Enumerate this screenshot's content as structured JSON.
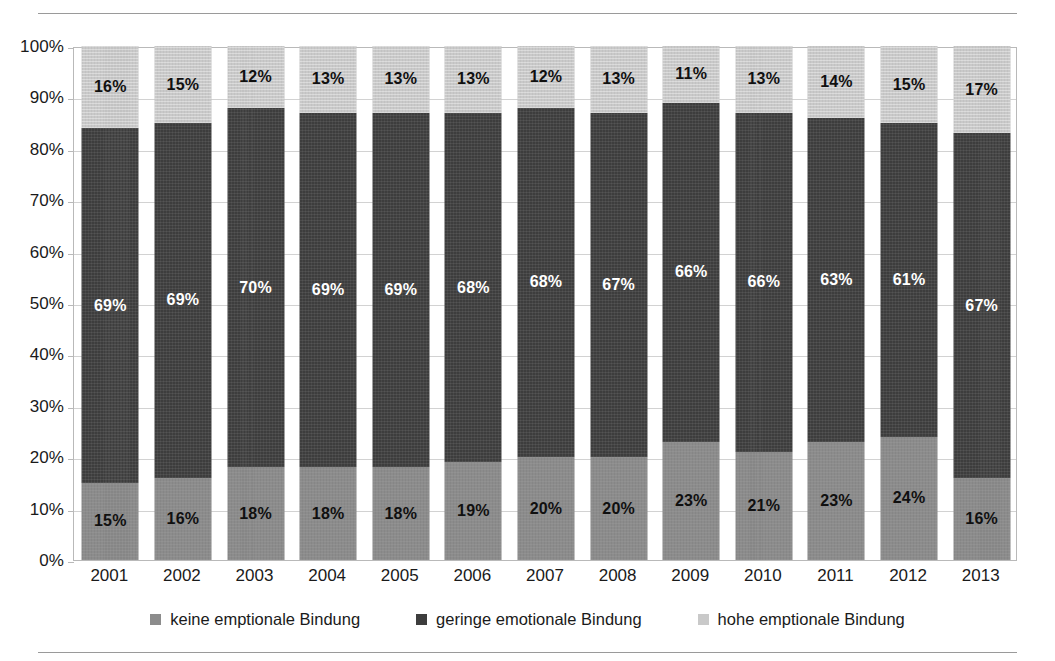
{
  "chart_data": {
    "type": "bar",
    "subtype": "stacked-bar-100",
    "title": "",
    "subtitle": "",
    "xlabel": "",
    "ylabel": "",
    "ylim": [
      0,
      100
    ],
    "ytick_labels": [
      "0%",
      "10%",
      "20%",
      "30%",
      "40%",
      "50%",
      "60%",
      "70%",
      "80%",
      "90%",
      "100%"
    ],
    "ytick_values": [
      0,
      10,
      20,
      30,
      40,
      50,
      60,
      70,
      80,
      90,
      100
    ],
    "grid": true,
    "legend_position": "bottom",
    "value_suffix": "%",
    "categories": [
      "2001",
      "2002",
      "2003",
      "2004",
      "2005",
      "2006",
      "2007",
      "2008",
      "2009",
      "2010",
      "2011",
      "2012",
      "2013"
    ],
    "series": [
      {
        "name": "keine emptionale Bindung",
        "key": "low",
        "color": "#8c8c8c",
        "label_color": "#101010",
        "values": [
          15,
          16,
          18,
          18,
          18,
          19,
          20,
          20,
          23,
          21,
          23,
          24,
          16
        ],
        "labels": [
          "15%",
          "16%",
          "18%",
          "18%",
          "18%",
          "19%",
          "20%",
          "20%",
          "23%",
          "21%",
          "23%",
          "24%",
          "16%"
        ]
      },
      {
        "name": "geringe emotionale Bindung",
        "key": "mid",
        "color": "#3d3d3d",
        "label_color": "#ffffff",
        "values": [
          69,
          69,
          70,
          69,
          69,
          68,
          68,
          67,
          66,
          66,
          63,
          61,
          67
        ],
        "labels": [
          "69%",
          "69%",
          "70%",
          "69%",
          "69%",
          "68%",
          "68%",
          "67%",
          "66%",
          "66%",
          "63%",
          "61%",
          "67%"
        ]
      },
      {
        "name": "hohe emptionale Bindung",
        "key": "high",
        "color": "#c9c9c9",
        "label_color": "#101010",
        "values": [
          16,
          15,
          12,
          13,
          13,
          13,
          12,
          13,
          11,
          13,
          14,
          15,
          17
        ],
        "labels": [
          "16%",
          "15%",
          "12%",
          "13%",
          "13%",
          "13%",
          "12%",
          "13%",
          "11%",
          "13%",
          "14%",
          "15%",
          "17%"
        ]
      }
    ]
  },
  "legend": {
    "items": [
      {
        "label": "keine emptionale Bindung",
        "swatch": "sw-low"
      },
      {
        "label": "geringe emotionale Bindung",
        "swatch": "sw-mid"
      },
      {
        "label": "hohe emptionale Bindung",
        "swatch": "sw-high"
      }
    ]
  }
}
